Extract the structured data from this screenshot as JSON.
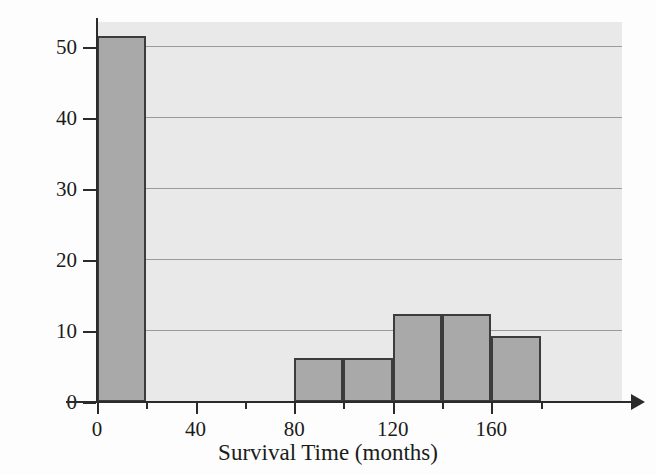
{
  "chart_data": {
    "type": "bar",
    "title": "",
    "subtitle": "",
    "xlabel": "Survival Time (months)",
    "ylabel": "Percent",
    "xlim": [
      0,
      213
    ],
    "ylim": [
      0,
      53.5
    ],
    "grid": "horizontal",
    "legend": "none",
    "bin_width": 20,
    "categories": [
      "0-20",
      "20-40",
      "40-60",
      "60-80",
      "80-100",
      "100-120",
      "120-140",
      "140-160",
      "160-180"
    ],
    "bin_starts": [
      0,
      20,
      40,
      60,
      80,
      100,
      120,
      140,
      160
    ],
    "values": [
      51.5,
      0,
      0,
      0,
      6.2,
      6.2,
      12.4,
      12.4,
      9.3
    ],
    "xticks": [
      {
        "value": 0,
        "label": "0",
        "type": "major"
      },
      {
        "value": 20,
        "label": "",
        "type": "minor"
      },
      {
        "value": 40,
        "label": "40",
        "type": "major"
      },
      {
        "value": 60,
        "label": "",
        "type": "minor"
      },
      {
        "value": 80,
        "label": "80",
        "type": "major"
      },
      {
        "value": 100,
        "label": "",
        "type": "minor"
      },
      {
        "value": 120,
        "label": "120",
        "type": "major"
      },
      {
        "value": 140,
        "label": "",
        "type": "minor"
      },
      {
        "value": 160,
        "label": "160",
        "type": "major"
      },
      {
        "value": 180,
        "label": "",
        "type": "minor"
      }
    ],
    "yticks": [
      {
        "value": 0,
        "label": "0"
      },
      {
        "value": 10,
        "label": "10"
      },
      {
        "value": 20,
        "label": "20"
      },
      {
        "value": 30,
        "label": "30"
      },
      {
        "value": 40,
        "label": "40"
      },
      {
        "value": 50,
        "label": "50"
      }
    ],
    "gridline_values": [
      10,
      20,
      30,
      40,
      50
    ],
    "colors": {
      "bar_fill": "#a9a9a9",
      "bar_edge": "#3c3c3c",
      "panel_background": "#e9e9e9",
      "gridline": "#9a9a9a",
      "axis": "#2b2b2b",
      "text": "#1b1b1b",
      "page_background": "#fdfdfd"
    }
  },
  "bleed_text": {
    "line1": "",
    "line2": ""
  }
}
